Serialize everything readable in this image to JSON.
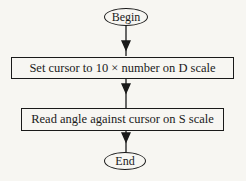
{
  "flowchart": {
    "nodes": [
      {
        "id": "begin",
        "type": "terminator",
        "label": "Begin"
      },
      {
        "id": "step1",
        "type": "process",
        "label": "Set cursor to 10 × number on D scale"
      },
      {
        "id": "step2",
        "type": "process",
        "label": "Read angle against cursor on S scale"
      },
      {
        "id": "end",
        "type": "terminator",
        "label": "End"
      }
    ],
    "edges": [
      {
        "from": "begin",
        "to": "step1"
      },
      {
        "from": "step1",
        "to": "step2"
      },
      {
        "from": "step2",
        "to": "end"
      }
    ]
  }
}
